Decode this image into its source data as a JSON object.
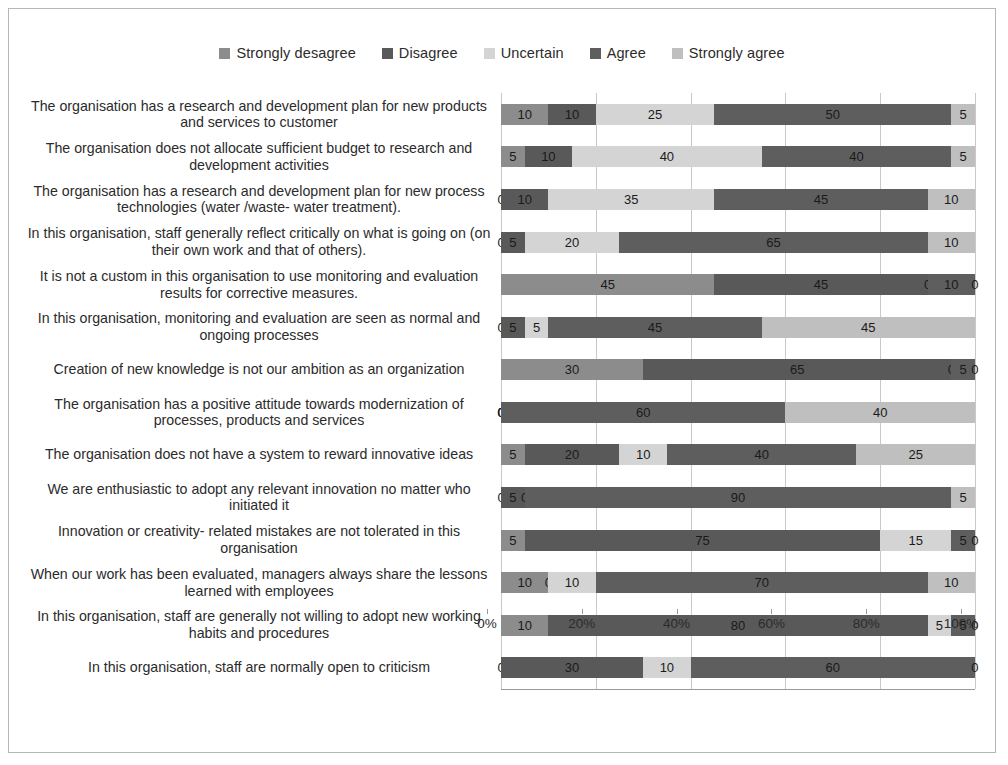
{
  "chart_data": {
    "type": "bar",
    "orientation": "horizontal",
    "stacked": true,
    "normalized_percent": true,
    "title": "",
    "xlabel": "",
    "ylabel": "",
    "xlim": [
      0,
      100
    ],
    "xticks": [
      "0%",
      "20%",
      "40%",
      "60%",
      "80%",
      "100%"
    ],
    "xtick_values": [
      0,
      20,
      40,
      60,
      80,
      100
    ],
    "grid": true,
    "legend_position": "top",
    "series": [
      {
        "name": "Strongly desagree",
        "color": "#8c8c8c",
        "values": [
          10,
          5,
          0,
          0,
          45,
          0,
          30,
          0,
          5,
          0,
          5,
          10,
          10,
          0
        ]
      },
      {
        "name": "Disagree",
        "color": "#595959",
        "values": [
          10,
          10,
          10,
          5,
          45,
          5,
          65,
          0,
          20,
          5,
          75,
          0,
          80,
          30
        ]
      },
      {
        "name": "Uncertain",
        "color": "#d4d4d4",
        "values": [
          25,
          40,
          35,
          20,
          0,
          5,
          0,
          0,
          10,
          0,
          15,
          10,
          5,
          10
        ]
      },
      {
        "name": "Agree",
        "color": "#5e5e5e",
        "values": [
          50,
          40,
          45,
          65,
          10,
          45,
          5,
          60,
          40,
          90,
          5,
          70,
          5,
          60
        ]
      },
      {
        "name": "Strongly agree",
        "color": "#bfbfbf",
        "values": [
          5,
          5,
          10,
          10,
          0,
          45,
          0,
          40,
          25,
          5,
          0,
          10,
          0,
          0
        ]
      }
    ],
    "categories": [
      "The organisation has a research and development plan for new products and services to customer",
      "The organisation does not allocate sufficient budget to research and development activities",
      "The organisation has a research and development plan for new process technologies (water /waste- water treatment).",
      "In this organisation, staff generally reflect critically on what is going on (on their own work and that of others).",
      "It is not a custom in this organisation to use monitoring and evaluation results for corrective measures.",
      "In this organisation, monitoring and evaluation are seen as normal and ongoing processes",
      "Creation of new knowledge is not our ambition as an organization",
      "The organisation has a positive attitude towards modernization of processes, products and services",
      "The organisation does not have a system to reward innovative ideas",
      "We are enthusiastic to adopt any relevant innovation no matter who initiated it",
      "Innovation or creativity- related mistakes are not tolerated in this organisation",
      "When our work has been evaluated, managers always share the lessons learned with employees",
      "In this organisation, staff are generally not willing to adopt new working habits and procedures",
      "In this organisation, staff are normally open to criticism"
    ]
  },
  "legend": {
    "items": [
      {
        "label": "Strongly desagree",
        "color": "#8c8c8c"
      },
      {
        "label": "Disagree",
        "color": "#595959"
      },
      {
        "label": "Uncertain",
        "color": "#d4d4d4"
      },
      {
        "label": "Agree",
        "color": "#5e5e5e"
      },
      {
        "label": "Strongly agree",
        "color": "#bfbfbf"
      }
    ]
  }
}
